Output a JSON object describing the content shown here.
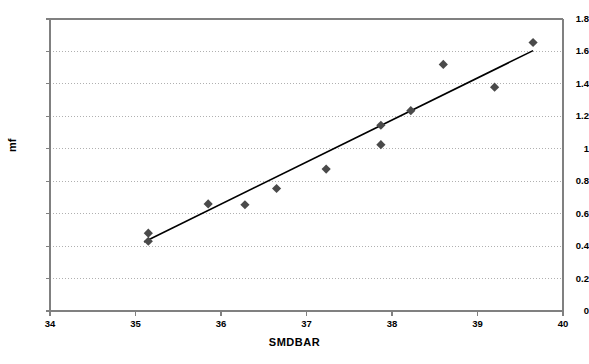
{
  "chart_data": {
    "type": "scatter",
    "title": "",
    "xlabel": "SMDBAR",
    "ylabel": "mf",
    "xlim": [
      34,
      40
    ],
    "ylim": [
      0,
      1.8
    ],
    "xticks": [
      "34",
      "35",
      "36",
      "37",
      "38",
      "39",
      "40"
    ],
    "xtick_values": [
      34,
      35,
      36,
      37,
      38,
      39,
      40
    ],
    "yticks": [
      "0",
      "0.2",
      "0.4",
      "0.6",
      "0.8",
      "1",
      "1.2",
      "1.4",
      "1.6",
      "1.8"
    ],
    "ytick_values": [
      0,
      0.2,
      0.4,
      0.6,
      0.8,
      1.0,
      1.2,
      1.4,
      1.6,
      1.8
    ],
    "grid": "horizontal-dotted",
    "legend": "none",
    "marker": "diamond",
    "marker_color": "#4a4a4a",
    "trendline_color": "#000000",
    "axis_color": "#808080",
    "gridline_color": "#b0b0b0",
    "series": [
      {
        "name": "mf vs SMDBAR",
        "points": [
          {
            "x": 35.15,
            "y": 0.48
          },
          {
            "x": 35.15,
            "y": 0.43
          },
          {
            "x": 35.85,
            "y": 0.66
          },
          {
            "x": 36.28,
            "y": 0.655
          },
          {
            "x": 36.65,
            "y": 0.755
          },
          {
            "x": 37.23,
            "y": 0.875
          },
          {
            "x": 37.87,
            "y": 1.145
          },
          {
            "x": 37.87,
            "y": 1.025
          },
          {
            "x": 38.22,
            "y": 1.235
          },
          {
            "x": 38.6,
            "y": 1.52
          },
          {
            "x": 39.2,
            "y": 1.38
          },
          {
            "x": 39.65,
            "y": 1.655
          }
        ]
      }
    ],
    "trendline": {
      "x_start": 35.1,
      "y_start": 0.425,
      "x_end": 39.65,
      "y_end": 1.605
    }
  }
}
